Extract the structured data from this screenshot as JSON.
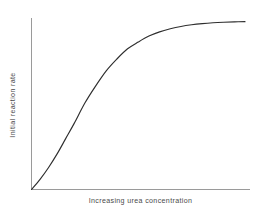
{
  "chart_data": {
    "type": "line",
    "title": "",
    "subtitle": "",
    "xlabel": "Increasing urea concentration",
    "ylabel": "Initial reaction rate",
    "grid": false,
    "legend": false,
    "legend_position": "none",
    "xlim": [
      0,
      100
    ],
    "ylim": [
      0,
      100
    ],
    "xticks": [],
    "yticks": [],
    "xticklabels": [],
    "yticklabels": [],
    "annotations": [],
    "series": [
      {
        "name": "Initial reaction rate vs urea concentration",
        "color": "#2e2e2e",
        "x": [
          0,
          4,
          8,
          12,
          16,
          20,
          25,
          30,
          35,
          40,
          45,
          50,
          55,
          60,
          65,
          70,
          75,
          80,
          85,
          90,
          95,
          100
        ],
        "y": [
          0,
          6,
          13,
          21,
          30,
          39,
          51,
          61,
          70,
          77,
          83,
          87,
          90.5,
          93,
          94.8,
          96.2,
          97.2,
          97.9,
          98.4,
          98.7,
          98.9,
          99
        ]
      }
    ]
  },
  "figure": {
    "background_color": "#ffffff",
    "axis_color": "#9a9a9a",
    "curve_color": "#2e2e2e",
    "label_color": "#4a4a4a"
  },
  "axes": {
    "x_axis_name": "x-axis",
    "y_axis_name": "y-axis"
  }
}
